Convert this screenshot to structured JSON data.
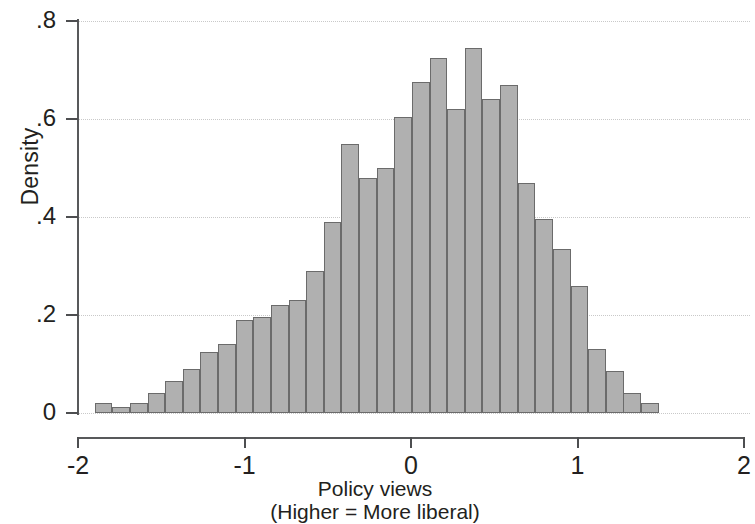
{
  "chart_data": {
    "type": "bar",
    "title": "",
    "subtitle": "",
    "xlabel": "Policy views",
    "xlabel_note": "(Higher = More liberal)",
    "ylabel": "Density",
    "xlim": [
      -2,
      2
    ],
    "ylim": [
      0,
      0.8
    ],
    "xticks": [
      "-2",
      "-1",
      "0",
      "1",
      "2"
    ],
    "xtick_values": [
      -2,
      -1,
      0,
      1,
      2
    ],
    "yticks": [
      "0",
      ".2",
      ".4",
      ".6",
      ".8"
    ],
    "ytick_values": [
      0,
      0.2,
      0.4,
      0.6,
      0.8
    ],
    "grid": "horizontal-dotted",
    "legend": "none",
    "bin_width": 0.1059,
    "bin_start": -1.9,
    "bin_centers": [
      -1.847,
      -1.741,
      -1.635,
      -1.529,
      -1.424,
      -1.318,
      -1.212,
      -1.106,
      -1.0,
      -0.894,
      -0.788,
      -0.682,
      -0.576,
      -0.471,
      -0.365,
      -0.259,
      -0.153,
      -0.047,
      0.059,
      0.165,
      0.271,
      0.376,
      0.482,
      0.588,
      0.694,
      0.8,
      0.906,
      1.012,
      1.118,
      1.224,
      1.329,
      1.435
    ],
    "categories": [
      "-1.85",
      "-1.74",
      "-1.64",
      "-1.53",
      "-1.42",
      "-1.32",
      "-1.21",
      "-1.11",
      "-1.00",
      "-0.89",
      "-0.79",
      "-0.68",
      "-0.58",
      "-0.47",
      "-0.36",
      "-0.26",
      "-0.15",
      "-0.05",
      "0.06",
      "0.16",
      "0.27",
      "0.38",
      "0.48",
      "0.59",
      "0.69",
      "0.80",
      "0.91",
      "1.01",
      "1.12",
      "1.22",
      "1.33",
      "1.43"
    ],
    "values": [
      0.02,
      0.012,
      0.02,
      0.04,
      0.065,
      0.09,
      0.125,
      0.14,
      0.19,
      0.195,
      0.22,
      0.23,
      0.29,
      0.39,
      0.55,
      0.48,
      0.5,
      0.605,
      0.675,
      0.725,
      0.62,
      0.745,
      0.64,
      0.67,
      0.47,
      0.395,
      0.335,
      0.26,
      0.13,
      0.085,
      0.04,
      0.02
    ],
    "colors": {
      "bar_fill": "#b0b0b0",
      "bar_edge": "#6b6b6b",
      "axis": "#58595b",
      "grid": "#c9c9c9",
      "text": "#231f20"
    }
  }
}
